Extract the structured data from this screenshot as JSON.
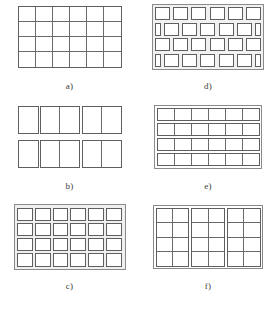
{
  "figure": {
    "background_color": "#ffffff",
    "line_color": "#5f5f5f",
    "frame_color": "#8a8a8a",
    "tile_fill": "#ffffff",
    "panel_fill": "#efefef",
    "columns": 2,
    "rows": 3
  },
  "panels": [
    {
      "id": "a",
      "label": "a)",
      "pattern": "contiguous-grid",
      "description": "6 by 4 grid of equal rectangular cells sharing edges, enclosed by an outer rectangle, no gaps",
      "cols": 6,
      "rows": 4,
      "gap_horizontal": false,
      "gap_vertical": false,
      "staggered": false
    },
    {
      "id": "b",
      "label": "b)",
      "pattern": "grouped-tall-cells",
      "description": "2 rows of 5 tall cells grouped into blocks of 1, 2 and 2 separated by vertical gaps",
      "cols": 5,
      "rows": 2,
      "column_groups": [
        1,
        2,
        2
      ],
      "gap_horizontal": true,
      "gap_vertical": true,
      "staggered": false
    },
    {
      "id": "c",
      "label": "c)",
      "pattern": "separated-tiles-aligned",
      "description": "6 by 4 array of individually outlined tiles separated by uniform gaps on a shaded panel",
      "cols": 6,
      "rows": 4,
      "gap_horizontal": true,
      "gap_vertical": true,
      "staggered": false
    },
    {
      "id": "d",
      "label": "d)",
      "pattern": "separated-tiles-staggered",
      "description": "4 rows of separated tiles in running-bond brick layout; rows 2 and 4 offset by half a tile leaving half tiles at both edges",
      "cols": 6,
      "rows": 4,
      "gap_horizontal": true,
      "gap_vertical": true,
      "staggered": true,
      "offset_rows": [
        2,
        4
      ]
    },
    {
      "id": "e",
      "label": "e)",
      "pattern": "row-separated-grid",
      "description": "6 by 4 grid where the four rows are separate horizontal bands divided by gaps; cells inside each band share vertical edges",
      "cols": 6,
      "rows": 4,
      "gap_horizontal": true,
      "gap_vertical": false,
      "staggered": false
    },
    {
      "id": "f",
      "label": "f)",
      "pattern": "column-separated-grid",
      "description": "6 by 4 grid where the columns are grouped into three vertical blocks separated by narrow gaps; rows share horizontal edges inside each block",
      "cols": 6,
      "rows": 4,
      "column_groups": [
        2,
        2,
        2
      ],
      "gap_horizontal": false,
      "gap_vertical": true,
      "staggered": false
    }
  ]
}
